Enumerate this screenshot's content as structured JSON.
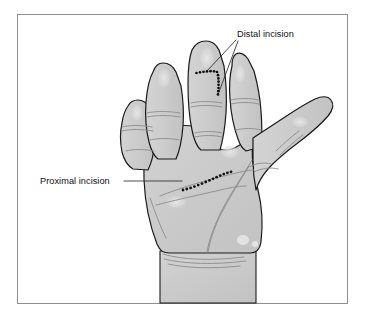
{
  "figure": {
    "view": "volar (palmar) view of left hand",
    "background_color": "#ffffff",
    "frame": {
      "name": "figure-border",
      "x": 17,
      "y": 14,
      "width": 331,
      "height": 290,
      "stroke_color": "#8a8a8a",
      "fill_color": "#ffffff"
    },
    "hand": {
      "fill_color": "#c9c9c9",
      "outline_color": "#1a1a1a",
      "crease_color": "#8c8c8c",
      "highlight_color": "#e0e0e0",
      "parts": [
        "thumb",
        "index-finger",
        "middle-finger",
        "ring-finger",
        "little-finger",
        "palm",
        "wrist"
      ]
    },
    "incisions": [
      {
        "id": "distal",
        "label": "Distal incision",
        "marker_color": "#111111",
        "location": "middle finger, proximal phalanx",
        "shape": "L-shaped dotted line: transverse limb then longitudinal limb",
        "dot_count": 17
      },
      {
        "id": "proximal",
        "label": "Proximal incision",
        "marker_color": "#111111",
        "location": "distal palm along distal palmar crease",
        "shape": "curved dotted line",
        "dot_count": 14
      }
    ],
    "labels": [
      {
        "id": "distal-incision-label",
        "text": "Distal incision",
        "x": 237,
        "y": 34,
        "anchor": "start",
        "leader_lines": 2
      },
      {
        "id": "proximal-incision-label",
        "text": "Proximal incision",
        "x": 40,
        "y": 184,
        "anchor": "start",
        "leader_lines": 1
      }
    ],
    "leader_line_color": "#2b2b2b"
  }
}
